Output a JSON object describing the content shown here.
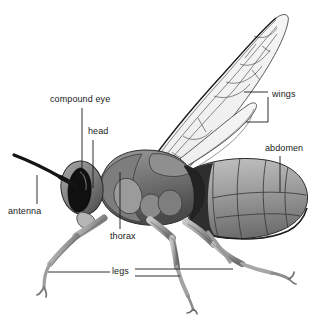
{
  "figure": {
    "kind": "anatomical-illustration",
    "background_color": "#ffffff",
    "line_color": "#1a1a1a",
    "body_tone_dark": "#3a3a3a",
    "body_tone_mid": "#8d8d8d",
    "body_tone_light": "#c9c9c9",
    "wing_fill": "#f4f4f4"
  },
  "labels": {
    "compound_eye": "compound eye",
    "head": "head",
    "antenna": "antenna",
    "thorax": "thorax",
    "legs": "legs",
    "wings": "wings",
    "abdomen": "abdomen"
  },
  "label_targets": {
    "compound_eye": "dark kidney-shaped eye on side of head",
    "head": "head capsule behind eye",
    "antenna": "long dark antenna projecting forward-left",
    "thorax": "mid-body segment bearing wings and legs",
    "legs": "three pairs of walking legs",
    "wings": "two membranous wings with venation cells",
    "abdomen": "large segmented rear body section"
  }
}
